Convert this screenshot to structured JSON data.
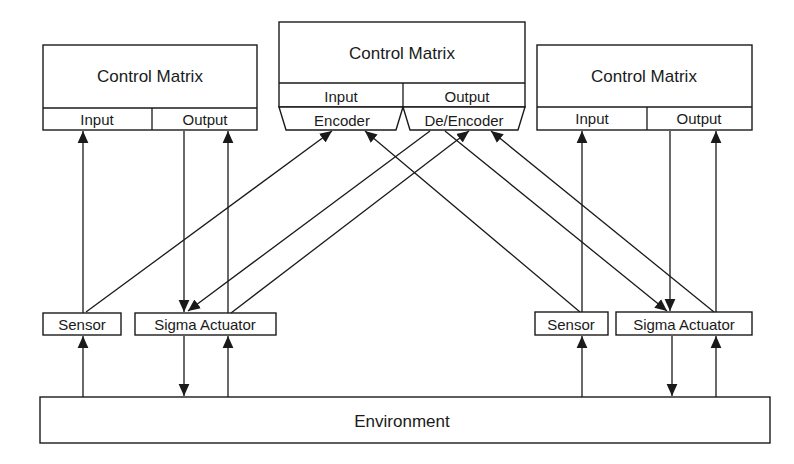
{
  "diagram": {
    "nodes": {
      "cm_left": {
        "title": "Control Matrix",
        "input": "Input",
        "output": "Output"
      },
      "cm_center": {
        "title": "Control Matrix",
        "input": "Input",
        "output": "Output",
        "encoder": "Encoder",
        "deencoder": "De/Encoder"
      },
      "cm_right": {
        "title": "Control Matrix",
        "input": "Input",
        "output": "Output"
      },
      "sensor_left": {
        "label": "Sensor"
      },
      "actuator_left": {
        "label": "Sigma Actuator"
      },
      "sensor_right": {
        "label": "Sensor"
      },
      "actuator_right": {
        "label": "Sigma Actuator"
      },
      "environment": {
        "label": "Environment"
      }
    },
    "edges": [
      {
        "from": "environment",
        "to": "sensor_left"
      },
      {
        "from": "sensor_left",
        "to": "cm_left.input"
      },
      {
        "from": "cm_left.output",
        "to": "actuator_left"
      },
      {
        "from": "actuator_left",
        "to": "cm_left.output"
      },
      {
        "from": "actuator_left",
        "to": "environment"
      },
      {
        "from": "environment",
        "to": "actuator_left"
      },
      {
        "from": "sensor_left",
        "to": "cm_center.encoder"
      },
      {
        "from": "cm_center.deencoder",
        "to": "actuator_left"
      },
      {
        "from": "actuator_left",
        "to": "cm_center.deencoder"
      },
      {
        "from": "sensor_right",
        "to": "cm_center.encoder"
      },
      {
        "from": "cm_center.deencoder",
        "to": "actuator_right"
      },
      {
        "from": "actuator_right",
        "to": "cm_center.deencoder"
      },
      {
        "from": "environment",
        "to": "sensor_right"
      },
      {
        "from": "sensor_right",
        "to": "cm_right.input"
      },
      {
        "from": "cm_right.output",
        "to": "actuator_right"
      },
      {
        "from": "actuator_right",
        "to": "cm_right.output"
      },
      {
        "from": "actuator_right",
        "to": "environment"
      },
      {
        "from": "environment",
        "to": "actuator_right"
      }
    ]
  }
}
